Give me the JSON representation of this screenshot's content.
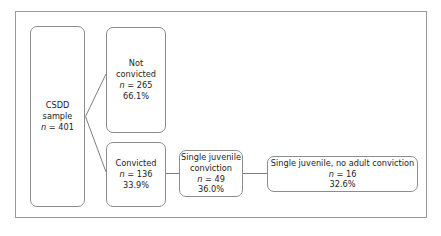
{
  "diagram": {
    "type": "flowchart",
    "background_color": "#ffffff",
    "border_color": "#9a9a9a",
    "node_border_color": "#8d8d8d",
    "text_color": "#232323",
    "nodes": [
      {
        "id": "csdd-sample",
        "name": "csdd-sample-node",
        "lines": [
          "CSDD",
          "sample"
        ],
        "n_label": "n",
        "n_value": "= 401",
        "percent": ""
      },
      {
        "id": "not-convicted",
        "name": "not-convicted-node",
        "lines": [
          "Not",
          "convicted"
        ],
        "n_label": "n",
        "n_value": "= 265",
        "percent": "66.1%"
      },
      {
        "id": "convicted",
        "name": "convicted-node",
        "lines": [
          "Convicted"
        ],
        "n_label": "n",
        "n_value": "= 136",
        "percent": "33.9%"
      },
      {
        "id": "single-juvenile-conviction",
        "name": "single-juvenile-conviction-node",
        "lines": [
          "Single juvenile",
          "conviction"
        ],
        "n_label": "n",
        "n_value": "= 49",
        "percent": "36.0%"
      },
      {
        "id": "single-juvenile-no-adult-conviction",
        "name": "single-juvenile-no-adult-conviction-node",
        "lines": [
          "Single juvenile, no adult conviction"
        ],
        "n_label": "n",
        "n_value": "= 16",
        "percent": "32.6%"
      }
    ],
    "edges": [
      {
        "from": "csdd-sample",
        "to": "not-convicted",
        "style": "diagonal"
      },
      {
        "from": "csdd-sample",
        "to": "convicted",
        "style": "diagonal"
      },
      {
        "from": "convicted",
        "to": "single-juvenile-conviction",
        "style": "horizontal"
      },
      {
        "from": "single-juvenile-conviction",
        "to": "single-juvenile-no-adult-conviction",
        "style": "horizontal"
      }
    ]
  }
}
